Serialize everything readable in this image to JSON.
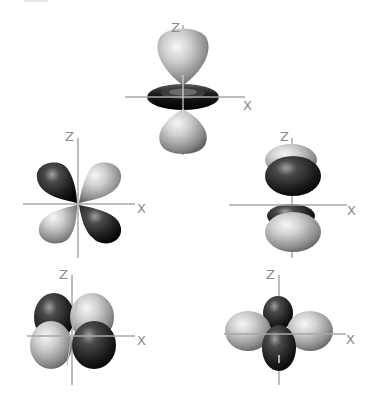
{
  "figure": {
    "axis_color": "#a8a8a8",
    "label_color": "#8a8a8a",
    "colors": {
      "light_lobe": "#c8c8c8",
      "light_lobe_highlight": "#f4f4f4",
      "light_lobe_shadow": "#6e6e6e",
      "dark_lobe": "#3a3a3a",
      "dark_lobe_highlight": "#9a9a9a",
      "dark_lobe_shadow": "#0e0e0e"
    }
  },
  "orbitals": [
    {
      "id": "dz2",
      "position": "top-center",
      "z_label": "Z",
      "x_label": "X"
    },
    {
      "id": "dxz",
      "position": "middle-left",
      "z_label": "Z",
      "x_label": "X"
    },
    {
      "id": "dyz",
      "position": "middle-right",
      "z_label": "Z",
      "x_label": "X"
    },
    {
      "id": "dxy",
      "position": "bottom-left",
      "z_label": "Z",
      "x_label": "X"
    },
    {
      "id": "dx2-y2",
      "position": "bottom-right",
      "z_label": "Z",
      "x_label": "X"
    }
  ]
}
